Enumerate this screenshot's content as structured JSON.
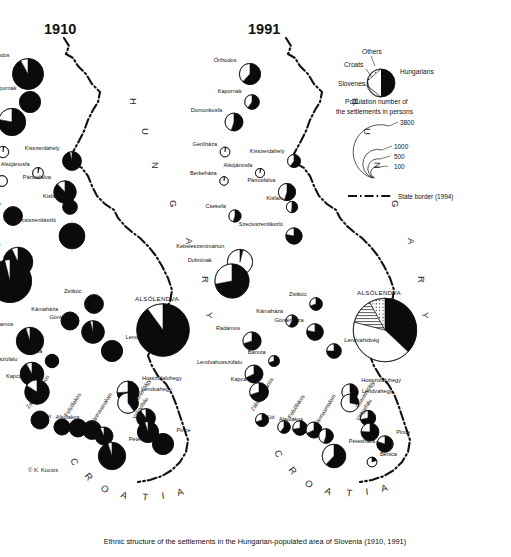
{
  "figure": {
    "caption": "Ethnic structure of the settlements in the Hungarian-populated area of Slovenia (1910, 1991)",
    "copyright": "© K. Kocsis",
    "panels": [
      {
        "id": "panel-1910",
        "title": "1910"
      },
      {
        "id": "panel-1991",
        "title": "1991"
      }
    ]
  },
  "legend": {
    "ethnic_title": "",
    "categories": [
      {
        "key": "others",
        "label": "Others",
        "pattern": "dotted",
        "color": "#ffffff"
      },
      {
        "key": "croats",
        "label": "Croats",
        "pattern": "hatched",
        "color": "#ffffff"
      },
      {
        "key": "slovenes",
        "label": "Slovenes",
        "pattern": "white",
        "color": "#ffffff"
      },
      {
        "key": "hungarians",
        "label": "Hungarians",
        "pattern": "solid",
        "color": "#0b0b0b"
      }
    ],
    "size_title_line1": "Population number of",
    "size_title_line2": "the settlements in persons",
    "size_classes": [
      "3800",
      "1000",
      "500",
      "100"
    ],
    "border_label": "State border (1994)"
  },
  "country_labels": [
    {
      "name": "HUNGARY",
      "letters": [
        "H",
        "U",
        "N",
        "G",
        "A",
        "R",
        "Y"
      ]
    },
    {
      "name": "CROATIA",
      "letters": [
        "C",
        "R",
        "O",
        "A",
        "T",
        "I",
        "A"
      ]
    }
  ],
  "settlements": {
    "panel_1910": [
      {
        "name": "Őrihodos",
        "x": 28,
        "y": 74,
        "pop": 900,
        "hu": 92,
        "sl": 8,
        "hr": 0,
        "ot": 0
      },
      {
        "name": "Kapornak",
        "x": 30,
        "y": 102,
        "pop": 420,
        "hu": 100,
        "sl": 0,
        "hr": 0,
        "ot": 0
      },
      {
        "name": "Domonkosfa",
        "x": 12,
        "y": 122,
        "pop": 700,
        "hu": 78,
        "sl": 22,
        "hr": 0,
        "ot": 0
      },
      {
        "name": "Gerőháza",
        "x": 3,
        "y": 152,
        "pop": 120,
        "hu": 3,
        "sl": 97,
        "hr": 0,
        "ot": 0
      },
      {
        "name": "Kisszerdahely",
        "x": 72,
        "y": 161,
        "pop": 330,
        "hu": 96,
        "sl": 4,
        "hr": 0,
        "ot": 0
      },
      {
        "name": "Alsójánosfa",
        "x": 38,
        "y": 173,
        "pop": 110,
        "hu": 4,
        "sl": 96,
        "hr": 0,
        "ot": 0
      },
      {
        "name": "Berkeháza",
        "x": 2,
        "y": 181,
        "pop": 110,
        "hu": 0,
        "sl": 100,
        "hr": 0,
        "ot": 0
      },
      {
        "name": "Pártosfalva",
        "x": 65,
        "y": 192,
        "pop": 470,
        "hu": 88,
        "sl": 12,
        "hr": 0,
        "ot": 0
      },
      {
        "name": "Kisfalu",
        "x": 70,
        "y": 207,
        "pop": 200,
        "hu": 100,
        "sl": 0,
        "hr": 0,
        "ot": 0
      },
      {
        "name": "Csekefa",
        "x": 13,
        "y": 216,
        "pop": 330,
        "hu": 100,
        "sl": 0,
        "hr": 0,
        "ot": 0
      },
      {
        "name": "Szecsiszentlászló",
        "x": 72,
        "y": 236,
        "pop": 620,
        "hu": 100,
        "sl": 0,
        "hr": 0,
        "ot": 0
      },
      {
        "name": "Kebeleszentmárton",
        "x": 18,
        "y": 262,
        "pop": 820,
        "hu": 93,
        "sl": 7,
        "hr": 0,
        "ot": 0
      },
      {
        "name": "Lendvavásárhely (Dobrónak)",
        "x": 10,
        "y": 281,
        "pop": 1750,
        "hu": 96,
        "sl": 4,
        "hr": 0,
        "ot": 0
      },
      {
        "name": "Zsitkóc",
        "x": 94,
        "y": 304,
        "pop": 330,
        "hu": 100,
        "sl": 0,
        "hr": 0,
        "ot": 0
      },
      {
        "name": "Kámaháza",
        "x": 70,
        "y": 321,
        "pop": 300,
        "hu": 100,
        "sl": 0,
        "hr": 0,
        "ot": 0
      },
      {
        "name": "Göntérháza",
        "x": 93,
        "y": 332,
        "pop": 480,
        "hu": 96,
        "sl": 4,
        "hr": 0,
        "ot": 0
      },
      {
        "name": "Radamos",
        "x": 30,
        "y": 341,
        "pop": 700,
        "hu": 95,
        "sl": 5,
        "hr": 0,
        "ot": 0
      },
      {
        "name": "Lendvahidvég",
        "x": 112,
        "y": 351,
        "pop": 420,
        "hu": 100,
        "sl": 0,
        "hr": 0,
        "ot": 0
      },
      {
        "name": "ALSÓLENDVA",
        "x": 163,
        "y": 330,
        "pop": 2600,
        "hu": 90,
        "sl": 10,
        "hr": 0,
        "ot": 0
      },
      {
        "name": "Bánuta",
        "x": 52,
        "y": 361,
        "pop": 170,
        "hu": 100,
        "sl": 0,
        "hr": 0,
        "ot": 0
      },
      {
        "name": "Lendvahosszúfalu",
        "x": 32,
        "y": 374,
        "pop": 520,
        "hu": 92,
        "sl": 8,
        "hr": 0,
        "ot": 0
      },
      {
        "name": "Hosszúfaluhegy",
        "x": 128,
        "y": 392,
        "pop": 450,
        "hu": 74,
        "sl": 26,
        "hr": 0,
        "ot": 0
      },
      {
        "name": "Kapca",
        "x": 37,
        "y": 392,
        "pop": 560,
        "hu": 84,
        "sl": 16,
        "hr": 0,
        "ot": 0
      },
      {
        "name": "Lendvahegy",
        "x": 128,
        "y": 403,
        "pop": 400,
        "hu": 40,
        "sl": 60,
        "hr": 0,
        "ot": 0
      },
      {
        "name": "Csentevölgy",
        "x": 146,
        "y": 418,
        "pop": 330,
        "hu": 90,
        "sl": 10,
        "hr": 0,
        "ot": 0
      },
      {
        "name": "Völgyifalu",
        "x": 148,
        "y": 432,
        "pop": 420,
        "hu": 95,
        "sl": 5,
        "hr": 0,
        "ot": 0
      },
      {
        "name": "Zalagyertyános",
        "x": 40,
        "y": 420,
        "pop": 300,
        "hu": 100,
        "sl": 0,
        "hr": 0,
        "ot": 0
      },
      {
        "name": "Kót",
        "x": 62,
        "y": 427,
        "pop": 240,
        "hu": 100,
        "sl": 0,
        "hr": 0,
        "ot": 0
      },
      {
        "name": "Felsőlakos",
        "x": 78,
        "y": 428,
        "pop": 300,
        "hu": 100,
        "sl": 0,
        "hr": 0,
        "ot": 0
      },
      {
        "name": "Alsólakos",
        "x": 92,
        "y": 430,
        "pop": 330,
        "hu": 100,
        "sl": 0,
        "hr": 0,
        "ot": 0
      },
      {
        "name": "Hármasmalom",
        "x": 104,
        "y": 436,
        "pop": 300,
        "hu": 93,
        "sl": 7,
        "hr": 0,
        "ot": 0
      },
      {
        "name": "Pince",
        "x": 163,
        "y": 444,
        "pop": 420,
        "hu": 100,
        "sl": 0,
        "hr": 0,
        "ot": 0
      },
      {
        "name": "Petesháza",
        "x": 112,
        "y": 456,
        "pop": 700,
        "hu": 95,
        "sl": 5,
        "hr": 0,
        "ot": 0
      }
    ],
    "panel_1991": [
      {
        "name": "Őrihodos",
        "x": 28,
        "y": 74,
        "pop": 420,
        "hu": 62,
        "sl": 38,
        "hr": 0,
        "ot": 0
      },
      {
        "name": "Kapornak",
        "x": 30,
        "y": 102,
        "pop": 200,
        "hu": 60,
        "sl": 40,
        "hr": 0,
        "ot": 0
      },
      {
        "name": "Domonkosfa",
        "x": 12,
        "y": 122,
        "pop": 300,
        "hu": 55,
        "sl": 45,
        "hr": 0,
        "ot": 0
      },
      {
        "name": "Gerőháza",
        "x": 3,
        "y": 152,
        "pop": 90,
        "hu": 3,
        "sl": 97,
        "hr": 0,
        "ot": 0
      },
      {
        "name": "Kisszerdahely",
        "x": 72,
        "y": 161,
        "pop": 160,
        "hu": 60,
        "sl": 40,
        "hr": 0,
        "ot": 0
      },
      {
        "name": "Alsójánosfa",
        "x": 38,
        "y": 173,
        "pop": 80,
        "hu": 4,
        "sl": 96,
        "hr": 0,
        "ot": 0
      },
      {
        "name": "Berkeháza",
        "x": 2,
        "y": 181,
        "pop": 70,
        "hu": 3,
        "sl": 97,
        "hr": 0,
        "ot": 0
      },
      {
        "name": "Pártosfalva",
        "x": 65,
        "y": 192,
        "pop": 280,
        "hu": 55,
        "sl": 45,
        "hr": 0,
        "ot": 0
      },
      {
        "name": "Kisfalu",
        "x": 70,
        "y": 207,
        "pop": 120,
        "hu": 52,
        "sl": 48,
        "hr": 0,
        "ot": 0
      },
      {
        "name": "Csekefa",
        "x": 13,
        "y": 216,
        "pop": 140,
        "hu": 55,
        "sl": 45,
        "hr": 0,
        "ot": 0
      },
      {
        "name": "Szecsiszentlászló",
        "x": 72,
        "y": 236,
        "pop": 250,
        "hu": 78,
        "sl": 22,
        "hr": 0,
        "ot": 0
      },
      {
        "name": "Kebeleszentmárton",
        "x": 18,
        "y": 262,
        "pop": 600,
        "hu": 4,
        "sl": 96,
        "hr": 0,
        "ot": 0
      },
      {
        "name": "Dobrónak",
        "x": 10,
        "y": 281,
        "pop": 1100,
        "hu": 72,
        "sl": 28,
        "hr": 0,
        "ot": 0
      },
      {
        "name": "Zsitkóc",
        "x": 94,
        "y": 304,
        "pop": 150,
        "hu": 70,
        "sl": 30,
        "hr": 0,
        "ot": 0
      },
      {
        "name": "Kámaháza",
        "x": 70,
        "y": 321,
        "pop": 140,
        "hu": 58,
        "sl": 42,
        "hr": 0,
        "ot": 0
      },
      {
        "name": "Göntérháza",
        "x": 93,
        "y": 332,
        "pop": 260,
        "hu": 78,
        "sl": 22,
        "hr": 0,
        "ot": 0
      },
      {
        "name": "Radamos",
        "x": 30,
        "y": 341,
        "pop": 310,
        "hu": 70,
        "sl": 30,
        "hr": 0,
        "ot": 0
      },
      {
        "name": "Lendvahidvég",
        "x": 112,
        "y": 351,
        "pop": 200,
        "hu": 75,
        "sl": 25,
        "hr": 0,
        "ot": 0
      },
      {
        "name": "ALSÓLENDVA",
        "x": 163,
        "y": 330,
        "pop": 3800,
        "hu": 37,
        "sl": 42,
        "hr": 13,
        "ot": 8
      },
      {
        "name": "Bánuta",
        "x": 52,
        "y": 361,
        "pop": 110,
        "hu": 70,
        "sl": 30,
        "hr": 0,
        "ot": 0
      },
      {
        "name": "Lendvahosszúfalu",
        "x": 32,
        "y": 374,
        "pop": 300,
        "hu": 68,
        "sl": 32,
        "hr": 0,
        "ot": 0
      },
      {
        "name": "Hosszúfaluhegy",
        "x": 128,
        "y": 392,
        "pop": 250,
        "hu": 45,
        "sl": 55,
        "hr": 0,
        "ot": 0
      },
      {
        "name": "Kapca",
        "x": 37,
        "y": 392,
        "pop": 330,
        "hu": 70,
        "sl": 30,
        "hr": 0,
        "ot": 0
      },
      {
        "name": "Lendvahegy",
        "x": 128,
        "y": 403,
        "pop": 300,
        "hu": 28,
        "sl": 72,
        "hr": 0,
        "ot": 0
      },
      {
        "name": "Csentevölgy",
        "x": 146,
        "y": 418,
        "pop": 220,
        "hu": 72,
        "sl": 28,
        "hr": 0,
        "ot": 0
      },
      {
        "name": "Völgyifalu",
        "x": 148,
        "y": 432,
        "pop": 300,
        "hu": 76,
        "sl": 24,
        "hr": 0,
        "ot": 0
      },
      {
        "name": "Zalagyertyános",
        "x": 40,
        "y": 420,
        "pop": 160,
        "hu": 70,
        "sl": 30,
        "hr": 0,
        "ot": 0
      },
      {
        "name": "Kót",
        "x": 62,
        "y": 427,
        "pop": 150,
        "hu": 60,
        "sl": 40,
        "hr": 0,
        "ot": 0
      },
      {
        "name": "Felsőlakos",
        "x": 78,
        "y": 428,
        "pop": 200,
        "hu": 72,
        "sl": 28,
        "hr": 0,
        "ot": 0
      },
      {
        "name": "Alsólakos",
        "x": 92,
        "y": 430,
        "pop": 240,
        "hu": 68,
        "sl": 32,
        "hr": 0,
        "ot": 0
      },
      {
        "name": "Hármasmalom",
        "x": 104,
        "y": 436,
        "pop": 200,
        "hu": 55,
        "sl": 45,
        "hr": 0,
        "ot": 0
      },
      {
        "name": "Pince",
        "x": 163,
        "y": 444,
        "pop": 250,
        "hu": 80,
        "sl": 20,
        "hr": 0,
        "ot": 0
      },
      {
        "name": "Petesháza",
        "x": 112,
        "y": 456,
        "pop": 520,
        "hu": 62,
        "sl": 38,
        "hr": 0,
        "ot": 0
      },
      {
        "name": "Benica",
        "x": 150,
        "y": 462,
        "pop": 90,
        "hu": 20,
        "sl": 80,
        "hr": 0,
        "ot": 0
      }
    ]
  },
  "chart_data": {
    "type": "pie",
    "panels": [
      "1910",
      "1991"
    ],
    "categories": [
      "Hungarians",
      "Slovenes",
      "Croats",
      "Others"
    ],
    "size_scale_persons": [
      3800,
      1000,
      500,
      100
    ],
    "note": "Each circle is a settlement; circle area ∝ population; slices = ethnic shares."
  }
}
